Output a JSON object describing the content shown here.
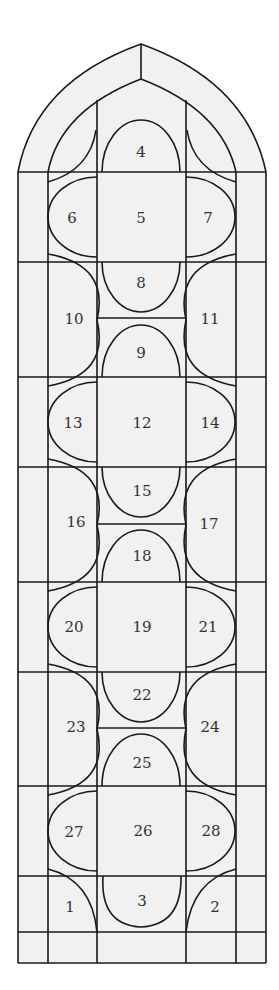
{
  "diagram": {
    "style": {
      "lead_color": "#1a1a1a",
      "glass_fill": "#f1f1f1",
      "number_color": "#333333",
      "background": "#ffffff"
    },
    "panels": [
      {
        "id": "1",
        "label": "1",
        "x": 70,
        "y": 908
      },
      {
        "id": "2",
        "label": "2",
        "x": 215,
        "y": 908
      },
      {
        "id": "3",
        "label": "3",
        "x": 142,
        "y": 902
      },
      {
        "id": "4",
        "label": "4",
        "x": 141,
        "y": 153
      },
      {
        "id": "5",
        "label": "5",
        "x": 141,
        "y": 219
      },
      {
        "id": "6",
        "label": "6",
        "x": 72,
        "y": 219
      },
      {
        "id": "7",
        "label": "7",
        "x": 208,
        "y": 219
      },
      {
        "id": "8",
        "label": "8",
        "x": 141,
        "y": 284
      },
      {
        "id": "9",
        "label": "9",
        "x": 141,
        "y": 354
      },
      {
        "id": "10",
        "label": "10",
        "x": 74,
        "y": 320
      },
      {
        "id": "11",
        "label": "11",
        "x": 210,
        "y": 320
      },
      {
        "id": "12",
        "label": "12",
        "x": 142,
        "y": 424
      },
      {
        "id": "13",
        "label": "13",
        "x": 73,
        "y": 424
      },
      {
        "id": "14",
        "label": "14",
        "x": 210,
        "y": 424
      },
      {
        "id": "15",
        "label": "15",
        "x": 142,
        "y": 492
      },
      {
        "id": "16",
        "label": "16",
        "x": 76,
        "y": 523
      },
      {
        "id": "17",
        "label": "17",
        "x": 209,
        "y": 525
      },
      {
        "id": "18",
        "label": "18",
        "x": 142,
        "y": 557
      },
      {
        "id": "19",
        "label": "19",
        "x": 142,
        "y": 628
      },
      {
        "id": "20",
        "label": "20",
        "x": 74,
        "y": 628
      },
      {
        "id": "21",
        "label": "21",
        "x": 208,
        "y": 628
      },
      {
        "id": "22",
        "label": "22",
        "x": 142,
        "y": 696
      },
      {
        "id": "23",
        "label": "23",
        "x": 76,
        "y": 728
      },
      {
        "id": "24",
        "label": "24",
        "x": 210,
        "y": 728
      },
      {
        "id": "25",
        "label": "25",
        "x": 142,
        "y": 764
      },
      {
        "id": "26",
        "label": "26",
        "x": 143,
        "y": 832
      },
      {
        "id": "27",
        "label": "27",
        "x": 74,
        "y": 833
      },
      {
        "id": "28",
        "label": "28",
        "x": 211,
        "y": 832
      }
    ]
  }
}
